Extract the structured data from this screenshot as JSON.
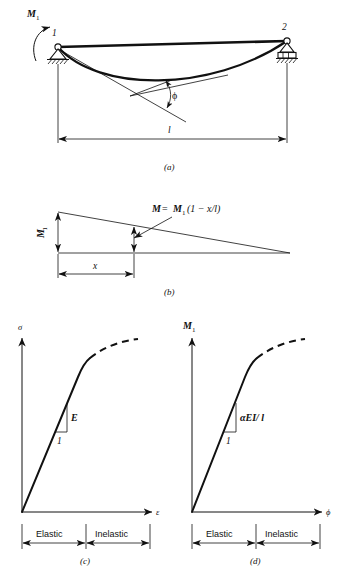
{
  "figure": {
    "panels": [
      {
        "id": "a",
        "caption": "(a)",
        "name": "beam-with-end-moment",
        "labels": {
          "moment": "M",
          "moment_sub": "1",
          "node_left": "1",
          "node_right": "2",
          "angle": "ϕ",
          "span": "l"
        }
      },
      {
        "id": "b",
        "caption": "(b)",
        "name": "bending-moment-diagram",
        "labels": {
          "moment": "M",
          "moment_sub": "1",
          "equation_lhs": "M",
          "equation_eq": "=",
          "equation_rhs_m": "M",
          "equation_rhs_sub": "1",
          "equation_rhs_paren": "(1 − x/l)",
          "distance": "x"
        }
      },
      {
        "id": "c",
        "caption": "(c)",
        "name": "stress-strain-curve",
        "labels": {
          "y_axis": "σ",
          "x_axis": "ε",
          "slope": "E",
          "run": "1",
          "region_elastic": "Elastic",
          "region_inelastic": "Inelastic"
        }
      },
      {
        "id": "d",
        "caption": "(d)",
        "name": "moment-rotation-curve",
        "labels": {
          "y_axis": "M",
          "y_axis_sub": "1",
          "x_axis": "ϕ",
          "slope": "αEI/ l",
          "run": "1",
          "region_elastic": "Elastic",
          "region_inelastic": "Inelastic"
        }
      }
    ],
    "colors": {
      "ink": "#111111",
      "paper": "#ffffff"
    }
  }
}
